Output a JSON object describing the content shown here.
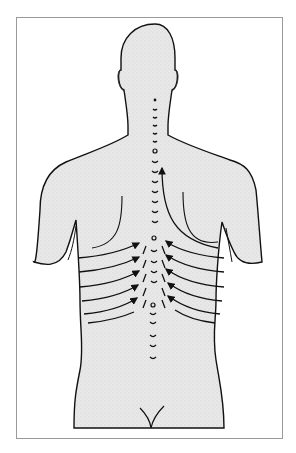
{
  "figure": {
    "colors": {
      "body_fill": "#e6e6e6",
      "outline": "#111111",
      "frame_border": "#9a9a9a",
      "background": "#ffffff"
    },
    "arrows": {
      "left_side_count": 6,
      "right_side_count": 6,
      "spinal_upward_count": 1
    }
  }
}
